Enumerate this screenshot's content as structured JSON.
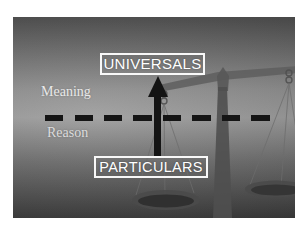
{
  "slide": {
    "top_box": {
      "label": "UNIVERSALS"
    },
    "bottom_box": {
      "label": "PARTICULARS"
    },
    "zone_labels": {
      "upper": "Meaning",
      "lower": "Reason"
    },
    "graphics": {
      "arrow": "up-arrow from particulars to universals",
      "divider": "horizontal dashed line",
      "background_image": "balance-scale"
    },
    "colors": {
      "page_margin": "#ffffff",
      "slide_bg_top": "#4e4e4e",
      "slide_bg_mid": "#9a9a9a",
      "slide_bg_bottom": "#3a3a3a",
      "box_border": "#ffffff",
      "box_text": "#ffffff",
      "zone_text": "#e9e9e9",
      "ink_black": "#141414",
      "scale_gray": "#5e5e5e"
    }
  }
}
